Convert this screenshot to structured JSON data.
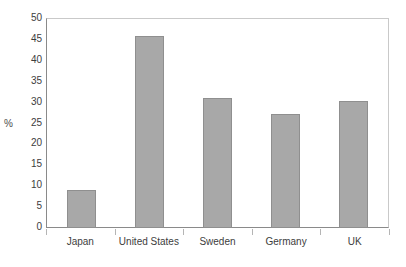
{
  "chart_data": {
    "type": "bar",
    "title": "",
    "xlabel": "",
    "ylabel": "%",
    "categories": [
      "Japan",
      "United States",
      "Sweden",
      "Germany",
      "UK"
    ],
    "values": [
      9,
      46,
      31,
      27.3,
      30.4
    ],
    "ylim": [
      0,
      50
    ],
    "ytick_step": 5,
    "yticks": [
      50,
      45,
      40,
      35,
      30,
      25,
      20,
      15,
      10,
      5,
      0
    ],
    "grid": false,
    "legend": null,
    "bar_color": "#a8a8a8",
    "bar_border_color": "#8f8f8f",
    "axis_color": "#8a8a8a",
    "frame_color": "#c9c9c9",
    "background": "#ffffff"
  }
}
